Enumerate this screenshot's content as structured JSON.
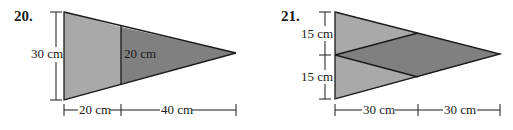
{
  "figures": [
    {
      "number": "20.",
      "height_label": "30 cm",
      "inner_label": "20 cm",
      "base_labels": [
        "20 cm",
        "40 cm"
      ],
      "colors": {
        "light": "#a9a9a9",
        "dark": "#808080"
      }
    },
    {
      "number": "21.",
      "height_labels": [
        "15 cm",
        "15 cm"
      ],
      "base_labels": [
        "30 cm",
        "30 cm"
      ],
      "colors": {
        "light": "#a9a9a9",
        "dark": "#808080"
      }
    }
  ]
}
